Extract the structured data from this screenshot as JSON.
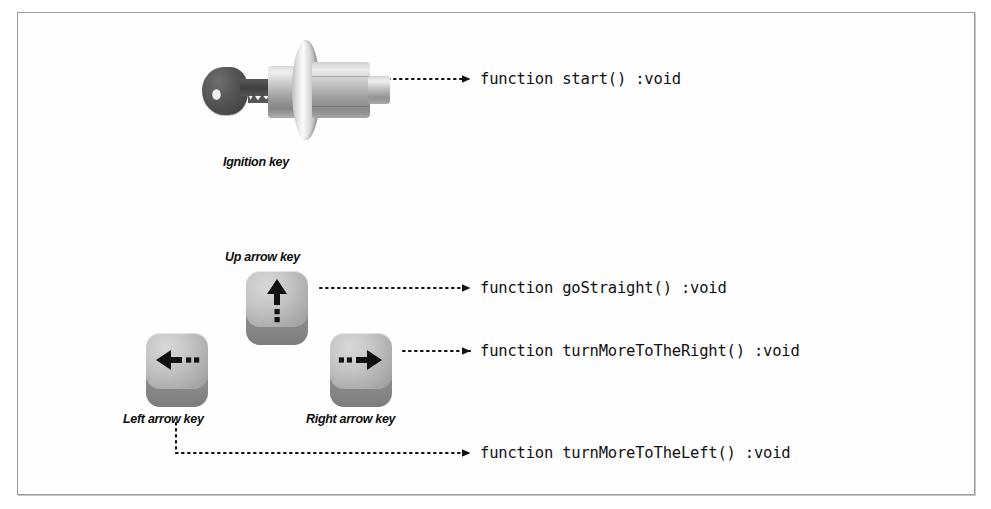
{
  "figure": {
    "border_color": "#9a9a9a",
    "background_color": "#ffffff"
  },
  "parts": [
    {
      "id": "ignition-key",
      "caption": "Ignition key",
      "icon": "ignition-key-cylinder-icon"
    },
    {
      "id": "up-arrow-key",
      "caption": "Up arrow key",
      "icon": "up-arrow-icon"
    },
    {
      "id": "left-arrow-key",
      "caption": "Left arrow key",
      "icon": "left-arrow-icon"
    },
    {
      "id": "right-arrow-key",
      "caption": "Right arrow key",
      "icon": "right-arrow-icon"
    }
  ],
  "functions": [
    {
      "id": "start",
      "signature": "function start() :void",
      "source_part": "ignition-key"
    },
    {
      "id": "go-straight",
      "signature": "function goStraight() :void",
      "source_part": "up-arrow-key"
    },
    {
      "id": "turn-more-to-the-right",
      "signature": "function turnMoreToTheRight() :void",
      "source_part": "right-arrow-key"
    },
    {
      "id": "turn-more-to-the-left",
      "signature": "function turnMoreToTheLeft() :void",
      "source_part": "left-arrow-key"
    }
  ],
  "connectors": [
    {
      "id": "connector-start",
      "style": "dotted-arrow",
      "color": "#111111"
    },
    {
      "id": "connector-gostraight",
      "style": "dotted-arrow",
      "color": "#111111"
    },
    {
      "id": "connector-right",
      "style": "dotted-arrow",
      "color": "#111111"
    },
    {
      "id": "connector-left",
      "style": "dotted-elbow-arrow",
      "color": "#111111"
    }
  ]
}
